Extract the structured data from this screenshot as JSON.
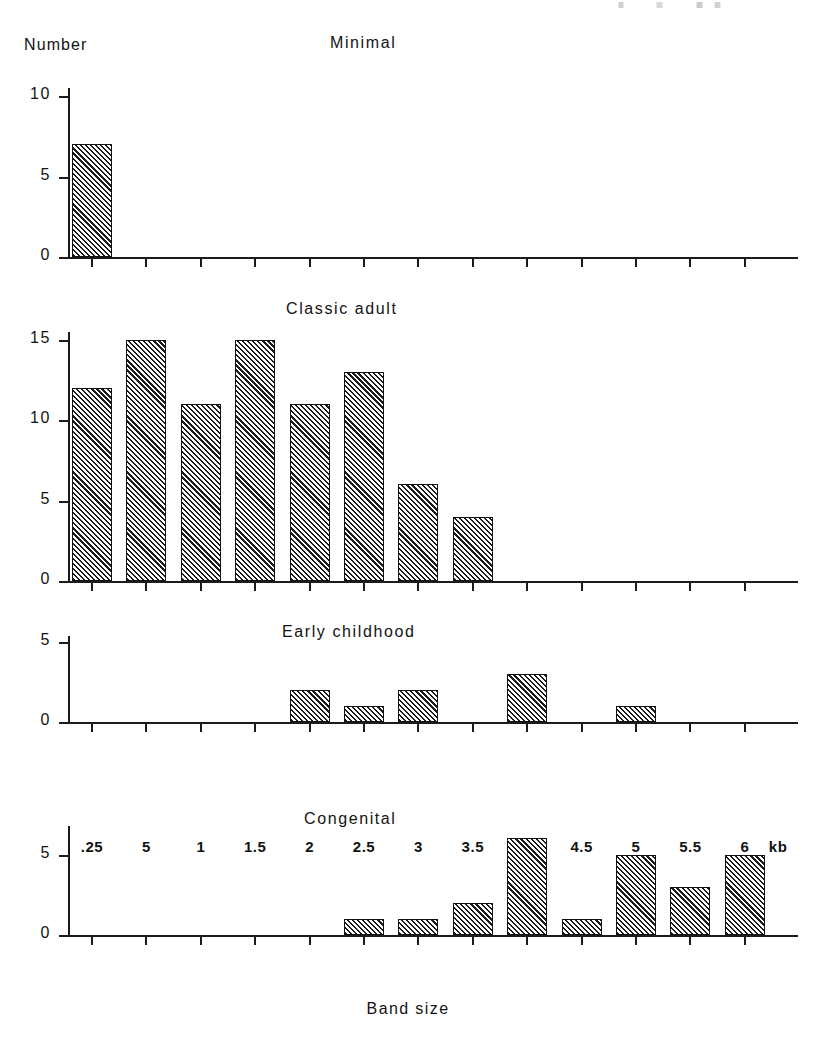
{
  "figure": {
    "y_axis_title": "Number",
    "x_axis_title": "Band size",
    "x_unit": "kb"
  },
  "chart_data": {
    "type": "bar",
    "title": "",
    "xlabel": "Band size",
    "ylabel": "Number",
    "x_unit": "kb",
    "grid": false,
    "legend": "none",
    "categories": [
      ".25",
      "5",
      "1",
      "1.5",
      "2",
      "2.5",
      "3",
      "3.5",
      "4",
      "4.5",
      "5",
      "5.5",
      "6"
    ],
    "panels": [
      {
        "title": "Minimal",
        "ylim": [
          0,
          10
        ],
        "yticks": [
          0,
          5,
          10
        ],
        "ytick_labels": [
          "0",
          "5",
          "10"
        ],
        "values": [
          7,
          0,
          0,
          0,
          0,
          0,
          0,
          0,
          0,
          0,
          0,
          0,
          0
        ]
      },
      {
        "title": "Classic  adult",
        "ylim": [
          0,
          15
        ],
        "yticks": [
          0,
          5,
          10,
          15
        ],
        "ytick_labels": [
          "0",
          "5",
          "10",
          "15"
        ],
        "values": [
          12,
          15,
          11,
          15,
          11,
          13,
          6,
          4,
          0,
          0,
          0,
          0,
          0
        ]
      },
      {
        "title": "Early childhood",
        "ylim": [
          0,
          6
        ],
        "yticks": [
          0,
          5
        ],
        "ytick_labels": [
          "0",
          "5"
        ],
        "values": [
          0,
          0,
          0,
          0,
          2,
          1,
          2,
          0,
          3,
          0,
          1,
          0,
          0
        ]
      },
      {
        "title": "Congenital",
        "ylim": [
          0,
          6.5
        ],
        "yticks": [
          0,
          5
        ],
        "ytick_labels": [
          "0",
          "5"
        ],
        "values": [
          0,
          0,
          0,
          0,
          0,
          1,
          1,
          2,
          6,
          1,
          5,
          3,
          5
        ]
      }
    ]
  },
  "layout": {
    "panel_tops": [
      88,
      332,
      636,
      826
    ],
    "panel_baselines": [
      257,
      581,
      722,
      935
    ],
    "panel_px_per_unit": [
      16.1,
      16.1,
      16.1,
      16.1
    ],
    "panel_title_positions": [
      {
        "left": 330,
        "top": 34
      },
      {
        "left": 286,
        "top": 300
      },
      {
        "left": 282,
        "top": 623
      },
      {
        "left": 304,
        "top": 810
      }
    ],
    "x_origin": 68,
    "x_first_tick": 92,
    "x_tick_spacing": 54.4,
    "bar_width": 40,
    "axis_width": 730
  },
  "colors": {
    "ink": "#1b1b1b",
    "paper": "#ffffff",
    "hatch": "#1c1c1c"
  }
}
